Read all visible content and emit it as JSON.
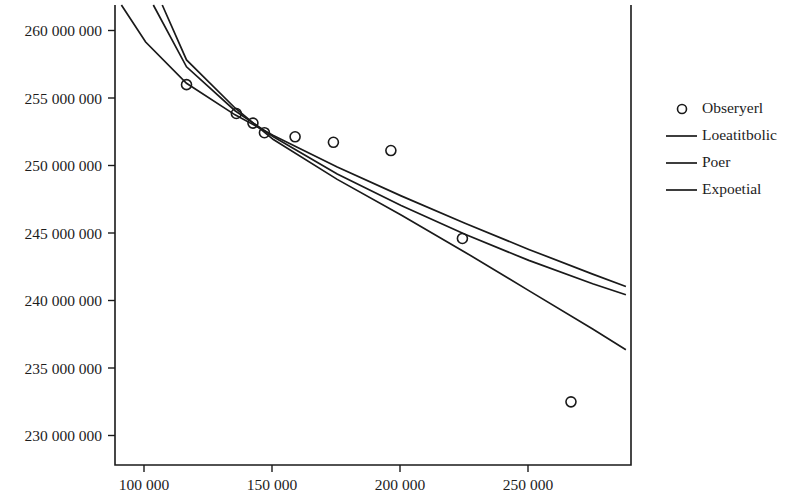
{
  "chart_data": {
    "type": "scatter",
    "title": "",
    "subtitle": "",
    "xlabel": "",
    "ylabel": "",
    "xlim": [
      88000,
      290000
    ],
    "ylim": [
      228500,
      262000
    ],
    "grid": false,
    "legend_position": "right",
    "xticks": [
      100000,
      150000,
      200000,
      250000
    ],
    "xtick_labels": [
      "100 000",
      "150 000",
      "200 000",
      "250 000"
    ],
    "yticks": [
      230000000,
      235000000,
      240000000,
      245000000,
      250000000,
      255000000,
      260000000
    ],
    "ytick_labels": [
      "230 000 000",
      "235 000 000",
      "240 000 000",
      "245 000 000",
      "250 000 000",
      "255 000 000",
      "260 000 000"
    ],
    "series": [
      {
        "name": "Obseryerl",
        "type": "scatter",
        "marker": "open-circle",
        "color": "#1a1a1a",
        "points": [
          {
            "x": 116000,
            "y": 256200000
          },
          {
            "x": 135500,
            "y": 254100000
          },
          {
            "x": 142000,
            "y": 253400000
          },
          {
            "x": 146500,
            "y": 252700000
          },
          {
            "x": 158500,
            "y": 252400000
          },
          {
            "x": 173500,
            "y": 252000000
          },
          {
            "x": 196000,
            "y": 251400000
          },
          {
            "x": 224000,
            "y": 245000000
          },
          {
            "x": 266500,
            "y": 233100000
          }
        ]
      },
      {
        "name": "Loeatitbolic",
        "type": "line",
        "color": "#1a1a1a",
        "points": [
          {
            "x": 90500,
            "y": 262000000
          },
          {
            "x": 100000,
            "y": 259300000
          },
          {
            "x": 116000,
            "y": 256300000
          },
          {
            "x": 135000,
            "y": 254000000
          },
          {
            "x": 150000,
            "y": 252500000
          },
          {
            "x": 175000,
            "y": 250200000
          },
          {
            "x": 200000,
            "y": 248100000
          },
          {
            "x": 225000,
            "y": 246100000
          },
          {
            "x": 250000,
            "y": 244200000
          },
          {
            "x": 275000,
            "y": 242400000
          },
          {
            "x": 288000,
            "y": 241500000
          }
        ]
      },
      {
        "name": "Poer",
        "type": "line",
        "color": "#1a1a1a",
        "points": [
          {
            "x": 103000,
            "y": 262000000
          },
          {
            "x": 116000,
            "y": 257500000
          },
          {
            "x": 135000,
            "y": 254300000
          },
          {
            "x": 150000,
            "y": 252400000
          },
          {
            "x": 175000,
            "y": 249700000
          },
          {
            "x": 200000,
            "y": 247400000
          },
          {
            "x": 225000,
            "y": 245300000
          },
          {
            "x": 250000,
            "y": 243400000
          },
          {
            "x": 275000,
            "y": 241700000
          },
          {
            "x": 288000,
            "y": 240900000
          }
        ]
      },
      {
        "name": "Expoetial",
        "type": "line",
        "color": "#1a1a1a",
        "points": [
          {
            "x": 106500,
            "y": 262000000
          },
          {
            "x": 116000,
            "y": 258000000
          },
          {
            "x": 135000,
            "y": 254500000
          },
          {
            "x": 150000,
            "y": 252200000
          },
          {
            "x": 175000,
            "y": 249300000
          },
          {
            "x": 200000,
            "y": 246700000
          },
          {
            "x": 225000,
            "y": 244000000
          },
          {
            "x": 250000,
            "y": 241200000
          },
          {
            "x": 275000,
            "y": 238400000
          },
          {
            "x": 288000,
            "y": 236900000
          }
        ]
      }
    ]
  },
  "legend": {
    "entries": [
      {
        "label": "Obseryerl",
        "marker": "open-circle"
      },
      {
        "label": "Loeatitbolic",
        "marker": "line"
      },
      {
        "label": "Poer",
        "marker": "line"
      },
      {
        "label": "Expoetial",
        "marker": "line"
      }
    ]
  }
}
